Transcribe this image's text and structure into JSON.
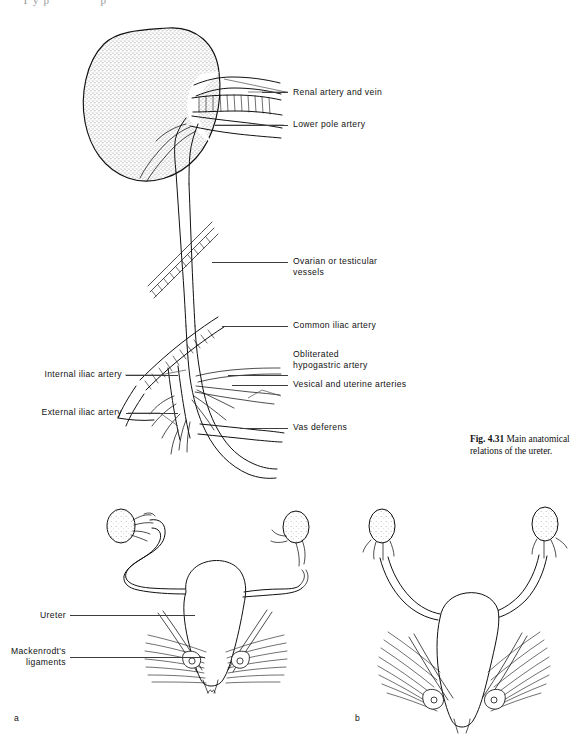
{
  "page": {
    "partial_top_text": "Typ      p",
    "background": "#ffffff",
    "ink_color": "#111111"
  },
  "figure_top": {
    "name": "ureter-anatomical-relations",
    "caption": {
      "figure_number": "Fig. 4.31",
      "text": "Main anatomical relations of the ureter.",
      "full": "Fig. 4.31 Main anatomical relations of the ureter."
    },
    "labels_right": [
      {
        "id": "renal-artery-and-vein",
        "text": "Renal artery and vein"
      },
      {
        "id": "lower-pole-artery",
        "text": "Lower pole artery"
      },
      {
        "id": "ovarian-or-testicular-vessels",
        "text": "Ovarian or testicular\nvessels"
      },
      {
        "id": "common-iliac-artery",
        "text": "Common iliac artery"
      },
      {
        "id": "obliterated-hypogastric-artery",
        "text": "Obliterated\nhypogastric artery"
      },
      {
        "id": "vesical-and-uterine-arteries",
        "text": "Vesical and uterine arteries"
      },
      {
        "id": "vas-deferens",
        "text": "Vas deferens"
      }
    ],
    "labels_left": [
      {
        "id": "internal-iliac-artery",
        "text": "Internal iliac artery"
      },
      {
        "id": "external-iliac-artery",
        "text": "External iliac artery"
      }
    ]
  },
  "figure_bottom": {
    "name": "uterus-ureter-mackenrodt-ligaments",
    "labels_left": [
      {
        "id": "ureter",
        "text": "Ureter"
      },
      {
        "id": "mackenrodts-ligaments",
        "text": "Mackenrodt's\nligaments"
      }
    ],
    "panels": [
      {
        "id": "panel-a",
        "letter": "a"
      },
      {
        "id": "panel-b",
        "letter": "b"
      }
    ]
  }
}
